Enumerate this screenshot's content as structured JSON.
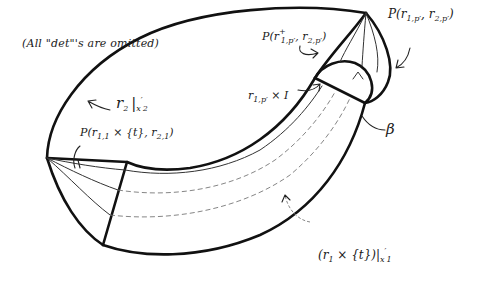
{
  "note": "(All \"det\"'s are omitted)",
  "labels": {
    "r2_restricted": {
      "main": "r",
      "sub": "2",
      "bar": "|",
      "restr": "x",
      "restr_prime": "′",
      "restr_sub": "2"
    },
    "p_top_right": {
      "text": "P(r",
      "sub1": "1,p′",
      "mid": ", r",
      "sub2": "2,p′",
      "close": ")"
    },
    "p_top_mid": {
      "text": "P(r",
      "sup": "+",
      "sub1": "1,p′",
      "mid": ", r",
      "sub2": "2,p′",
      "close": ")"
    },
    "r1p_times_I": {
      "text": "r",
      "sub": "1,p′",
      "rest": " × I"
    },
    "beta": "β",
    "p_left": {
      "text": "P(r",
      "sub1": "1,1",
      "mid": " × {t}, r",
      "sub2": "2,1",
      "close": ")"
    },
    "r1_times_t": {
      "open": "(r",
      "sub": "1",
      "mid": " × {t})",
      "bar": "|",
      "restr": "x",
      "restr_prime": "′",
      "restr_sub": "1"
    }
  },
  "colors": {
    "ink": "#111111",
    "background": "#ffffff"
  }
}
